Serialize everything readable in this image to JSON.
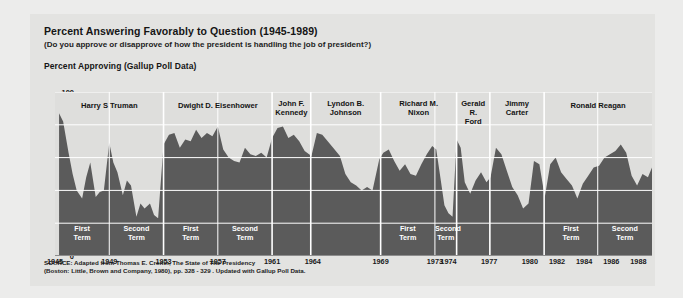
{
  "card": {
    "title": "Percent Answering Favorably to Question (1945-1989)",
    "subtitle": "(Do you approve or disapprove of how the president is handling the job of president?)",
    "axis_title": "Percent Approving (Gallup Poll Data)",
    "source_line1": "SOURCE: Adapted from Thomas E. Cronin, The State of The Presidency",
    "source_line2": "(Boston: Little, Brown and Company, 1980), pp. 328 - 329 . Updated with Gallup Poll Data."
  },
  "colors": {
    "page_bg": "#ececeb",
    "card_bg": "#e3e3e1",
    "plot_bg": "#dededc",
    "area_fill": "#5b5b5b",
    "grid": "#ffffff",
    "text": "#151515",
    "term_text": "#ffffff"
  },
  "chart_data": {
    "type": "area",
    "title": "Percent Answering Favorably to Question (1945-1989)",
    "subtitle": "(Do you approve or disapprove of how the president is handling the job of president?)",
    "xlabel": "",
    "ylabel": "Percent Approving (Gallup Poll Data)",
    "ylim": [
      0,
      100
    ],
    "xlim": [
      1945,
      1989
    ],
    "yticks": [
      0,
      20,
      40,
      60,
      80,
      100
    ],
    "ytick_labels": [
      "0",
      "20",
      "40",
      "60",
      "80",
      "100"
    ],
    "xtick_labels": [
      "1945",
      "1949",
      "1953",
      "1957",
      "1961",
      "1964",
      "1969",
      "1973",
      "1974",
      "1977",
      "1980",
      "1982",
      "1984",
      "1986",
      "1988"
    ],
    "xtick_values": [
      1945,
      1949,
      1953,
      1957,
      1961,
      1964,
      1969,
      1973,
      1974,
      1977,
      1980,
      1982,
      1984,
      1986,
      1988
    ],
    "grid": true,
    "legend": "none",
    "series_name": "Percent Approving",
    "x": [
      1945.3,
      1945.6,
      1946.0,
      1946.3,
      1946.6,
      1947.0,
      1947.3,
      1947.6,
      1948.0,
      1948.3,
      1948.6,
      1949.0,
      1949.3,
      1949.6,
      1950.0,
      1950.3,
      1950.6,
      1951.0,
      1951.3,
      1951.6,
      1952.0,
      1952.3,
      1952.6,
      1953.0,
      1953.4,
      1953.8,
      1954.2,
      1954.6,
      1955.0,
      1955.4,
      1955.8,
      1956.2,
      1956.6,
      1957.0,
      1957.4,
      1957.8,
      1958.2,
      1958.6,
      1959.0,
      1959.4,
      1959.8,
      1960.2,
      1960.6,
      1961.0,
      1961.4,
      1961.8,
      1962.2,
      1962.6,
      1963.0,
      1963.4,
      1963.9,
      1964.3,
      1964.7,
      1965.1,
      1965.5,
      1966.0,
      1966.4,
      1966.8,
      1967.2,
      1967.6,
      1968.0,
      1968.4,
      1968.9,
      1969.2,
      1969.6,
      1970.0,
      1970.4,
      1970.8,
      1971.2,
      1971.6,
      1972.0,
      1972.4,
      1972.8,
      1973.1,
      1973.4,
      1973.7,
      1974.0,
      1974.3,
      1974.6,
      1974.9,
      1975.2,
      1975.6,
      1976.0,
      1976.4,
      1976.8,
      1977.1,
      1977.5,
      1977.9,
      1978.3,
      1978.7,
      1979.1,
      1979.5,
      1979.9,
      1980.3,
      1980.7,
      1981.1,
      1981.5,
      1981.9,
      1982.3,
      1982.7,
      1983.1,
      1983.5,
      1983.9,
      1984.3,
      1984.7,
      1985.1,
      1985.5,
      1985.9,
      1986.3,
      1986.7,
      1987.1,
      1987.5,
      1987.9,
      1988.3,
      1988.7,
      1989.0
    ],
    "y": [
      87,
      82,
      63,
      50,
      40,
      35,
      48,
      57,
      36,
      39,
      40,
      69,
      57,
      51,
      37,
      46,
      43,
      24,
      32,
      29,
      32,
      25,
      23,
      68,
      74,
      75,
      66,
      71,
      70,
      77,
      72,
      75,
      73,
      79,
      65,
      60,
      58,
      57,
      66,
      62,
      61,
      63,
      60,
      72,
      78,
      79,
      72,
      74,
      70,
      64,
      61,
      75,
      74,
      70,
      66,
      61,
      50,
      45,
      43,
      40,
      42,
      40,
      59,
      63,
      65,
      58,
      52,
      56,
      50,
      49,
      56,
      62,
      67,
      65,
      48,
      31,
      26,
      24,
      71,
      66,
      45,
      38,
      46,
      51,
      45,
      48,
      66,
      62,
      52,
      42,
      37,
      29,
      32,
      58,
      56,
      36,
      56,
      60,
      51,
      47,
      43,
      35,
      44,
      49,
      54,
      55,
      60,
      62,
      64,
      68,
      63,
      49,
      43,
      50,
      48,
      54,
      57,
      57
    ],
    "presidents": [
      {
        "name": "Harry S Truman",
        "start": 1945,
        "end": 1953.0,
        "terms": [
          {
            "label": "First Term",
            "start": 1945,
            "end": 1949
          },
          {
            "label": "Second Term",
            "start": 1949,
            "end": 1953
          }
        ]
      },
      {
        "name": "Dwight D. Eisenhower",
        "start": 1953.0,
        "end": 1961.0,
        "terms": [
          {
            "label": "First Term",
            "start": 1953,
            "end": 1957
          },
          {
            "label": "Second Term",
            "start": 1957,
            "end": 1961
          }
        ]
      },
      {
        "name": "John F. Kennedy",
        "start": 1961.0,
        "end": 1963.85,
        "terms": []
      },
      {
        "name": "Lyndon B. Johnson",
        "start": 1963.85,
        "end": 1969.0,
        "terms": []
      },
      {
        "name": "Richard M. Nixon",
        "start": 1969.0,
        "end": 1974.6,
        "terms": [
          {
            "label": "First Term",
            "start": 1969,
            "end": 1973
          },
          {
            "label": "Second Term",
            "start": 1973,
            "end": 1974.6
          }
        ]
      },
      {
        "name": "Gerald R. Ford",
        "start": 1974.6,
        "end": 1977.05,
        "terms": []
      },
      {
        "name": "Jimmy Carter",
        "start": 1977.05,
        "end": 1981.05,
        "terms": []
      },
      {
        "name": "Ronald Reagan",
        "start": 1981.05,
        "end": 1989.0,
        "terms": [
          {
            "label": "First Term",
            "start": 1981.05,
            "end": 1985
          },
          {
            "label": "Second Term",
            "start": 1985,
            "end": 1989
          }
        ]
      }
    ]
  }
}
